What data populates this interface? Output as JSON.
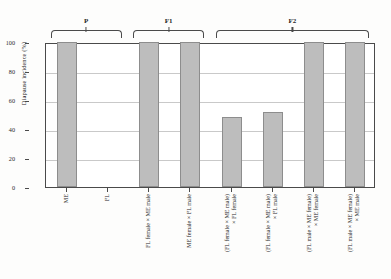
{
  "chart_data": {
    "type": "bar",
    "title": "",
    "subtitle": "",
    "xlabel": "",
    "ylabel": "Diapause incidence (%)",
    "ylim": [
      0,
      100
    ],
    "ytick_values": [
      0,
      20,
      40,
      60,
      80,
      100
    ],
    "ytick_labels": [
      "0",
      "20",
      "40",
      "60",
      "80",
      "100"
    ],
    "grid": "horizontal",
    "legend": "none",
    "bar_color": "#bdbdbd",
    "bar_edge_color": "#8d8d8d",
    "axis_color": "#4a4a4a",
    "gridline_color": "#c9c9c9",
    "categories": [
      "ME",
      "FL",
      "FL female × ME male",
      "ME female × FL male",
      "(FL female × ME male) × FL female",
      "(FL female × ME male) × FL male",
      "(FL male × ME female) × ME female",
      "(FL male × ME female) × ME male"
    ],
    "values": [
      100,
      0,
      100,
      100,
      48,
      52,
      100,
      100
    ],
    "groups": [
      {
        "label": "P",
        "first_index": 0,
        "last_index": 1
      },
      {
        "label": "F1",
        "first_index": 2,
        "last_index": 3
      },
      {
        "label": "F2",
        "first_index": 4,
        "last_index": 7
      }
    ]
  },
  "x_labels": [
    {
      "line1": "ME",
      "line2": ""
    },
    {
      "line1": "FL",
      "line2": ""
    },
    {
      "line1": "FL female × ME male",
      "line2": ""
    },
    {
      "line1": "ME female × FL male",
      "line2": ""
    },
    {
      "line1": "(FL female × ME male)",
      "line2": "× FL female"
    },
    {
      "line1": "(FL female × ME male)",
      "line2": "× FL male"
    },
    {
      "line1": "(FL male × ME female)",
      "line2": "× ME female"
    },
    {
      "line1": "(FL male × ME female)",
      "line2": "× ME male"
    }
  ]
}
